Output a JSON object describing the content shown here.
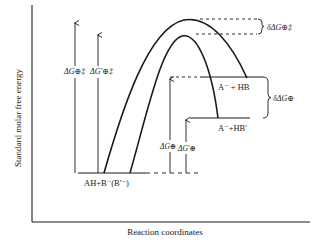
{
  "figure": {
    "y_axis_label": "Standard molar free energy",
    "x_axis_label": "Reaction coordinates"
  },
  "labels": {
    "reactants": "AH+B⁻(B′⁻)",
    "products_1": "A⁻ + HB",
    "products_2": "A⁻+HB′",
    "dG_act": "ΔG⊕‡",
    "dG_act_prime": "ΔG′⊕‡",
    "dG": "ΔG⊕",
    "dG_prime": "ΔG′⊕",
    "delta_dG_act": "δΔG⊕‡",
    "delta_dG": "δΔG⊕"
  },
  "colors": {
    "ink": "#1a1a1a",
    "background": "#ffffff"
  }
}
